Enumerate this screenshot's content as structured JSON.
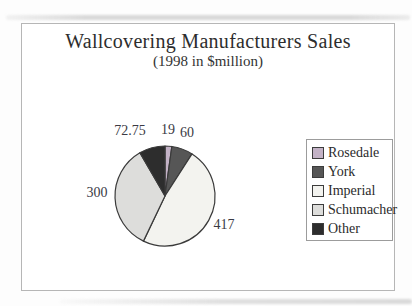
{
  "title": "Wallcovering Manufacturers Sales",
  "subtitle": "(1998 in $million)",
  "chart_data": {
    "type": "pie",
    "title": "Wallcovering Manufacturers Sales",
    "subtitle": "(1998 in $million)",
    "unit": "$million",
    "slices": [
      {
        "label": "Rosedale",
        "value": 19,
        "color": "#c3b2c6"
      },
      {
        "label": "York",
        "value": 60,
        "color": "#565656"
      },
      {
        "label": "Imperial",
        "value": 417,
        "color": "#f3f3ef"
      },
      {
        "label": "Schumacher",
        "value": 300,
        "color": "#dddddb"
      },
      {
        "label": "Other",
        "value": 72.75,
        "color": "#2d2d2d"
      }
    ],
    "value_labels": [
      "19",
      "60",
      "417",
      "300",
      "72.75"
    ],
    "start_angle_deg": 0,
    "direction": "clockwise",
    "legend_position": "right",
    "slice_stroke": "#3a3a3a",
    "label_color": "#3a3a44"
  },
  "frame": {
    "border_color": "#b6b6b6"
  }
}
